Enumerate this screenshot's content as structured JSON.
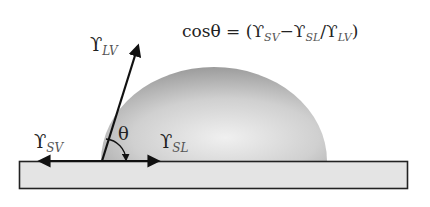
{
  "formula": {
    "lhs": "cosθ",
    "equals": " = ",
    "open_paren": "(",
    "term1_symbol": "ϒ",
    "term1_sub": "SV",
    "minus": "−",
    "term2_symbol": "ϒ",
    "term2_sub": "SL",
    "divide": "/",
    "term3_symbol": "ϒ",
    "term3_sub": "LV",
    "close_paren": ")"
  },
  "labels": {
    "gamma_lv": {
      "symbol": "ϒ",
      "sub": "LV"
    },
    "gamma_sv": {
      "symbol": "ϒ",
      "sub": "SV"
    },
    "gamma_sl": {
      "symbol": "ϒ",
      "sub": "SL"
    },
    "theta": "θ"
  },
  "colors": {
    "substrate_fill": "#e4e4e4",
    "substrate_stroke": "#222222",
    "droplet_light": "#ececec",
    "droplet_dark": "#9a9a9a",
    "vector": "#111111"
  }
}
